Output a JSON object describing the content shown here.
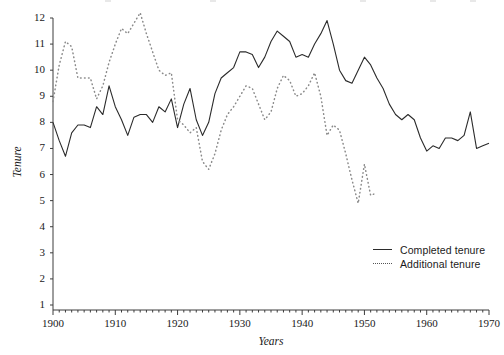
{
  "chart_data": {
    "type": "line",
    "title": "",
    "xlabel": "Years",
    "ylabel": "Tenure",
    "xlim": [
      1900,
      1970
    ],
    "ylim": [
      0,
      12
    ],
    "xticks": [
      1900,
      1910,
      1920,
      1930,
      1940,
      1950,
      1960,
      1970
    ],
    "yticks": [
      1,
      2,
      3,
      4,
      5,
      6,
      7,
      8,
      9,
      10,
      11,
      12
    ],
    "xtick_labels": [
      "1900",
      "1910",
      "1920",
      "1930",
      "1940",
      "1950",
      "1960",
      "1970"
    ],
    "ytick_labels": [
      "1",
      "2",
      "3",
      "4",
      "5",
      "6",
      "7",
      "8",
      "9",
      "10",
      "11",
      "12"
    ],
    "grid": false,
    "legend_position": "lower-right",
    "series": [
      {
        "name": "Completed tenure",
        "style": "solid",
        "color": "#2b2b2b",
        "x": [
          1900,
          1901,
          1902,
          1903,
          1904,
          1905,
          1906,
          1907,
          1908,
          1909,
          1910,
          1911,
          1912,
          1913,
          1914,
          1915,
          1916,
          1917,
          1918,
          1919,
          1920,
          1921,
          1922,
          1923,
          1924,
          1925,
          1926,
          1927,
          1928,
          1929,
          1930,
          1931,
          1932,
          1933,
          1934,
          1935,
          1936,
          1937,
          1938,
          1939,
          1940,
          1941,
          1942,
          1943,
          1944,
          1945,
          1946,
          1947,
          1948,
          1949,
          1950,
          1951,
          1952,
          1953,
          1954,
          1955,
          1956,
          1957,
          1958,
          1959,
          1960,
          1961,
          1962,
          1963,
          1964,
          1965,
          1966,
          1967,
          1968,
          1969,
          1970
        ],
        "values": [
          8.0,
          7.3,
          6.7,
          7.6,
          7.9,
          7.9,
          7.8,
          8.6,
          8.3,
          9.4,
          8.6,
          8.1,
          7.5,
          8.2,
          8.3,
          8.3,
          8.0,
          8.6,
          8.4,
          8.9,
          7.8,
          8.7,
          9.3,
          8.1,
          7.5,
          8.0,
          9.1,
          9.7,
          9.9,
          10.1,
          10.7,
          10.7,
          10.6,
          10.1,
          10.5,
          11.1,
          11.5,
          11.3,
          11.1,
          10.5,
          10.6,
          10.5,
          11.0,
          11.4,
          11.9,
          11.0,
          10.0,
          9.6,
          9.5,
          10.0,
          10.5,
          10.2,
          9.7,
          9.3,
          8.7,
          8.3,
          8.1,
          8.3,
          8.1,
          7.4,
          6.9,
          7.1,
          7.0,
          7.4,
          7.4,
          7.3,
          7.5,
          8.4,
          7.0,
          7.1,
          7.2
        ]
      },
      {
        "name": "Additional tenure",
        "style": "dotted",
        "color": "#808080",
        "x": [
          1900,
          1901,
          1902,
          1903,
          1904,
          1905,
          1906,
          1907,
          1908,
          1909,
          1910,
          1911,
          1912,
          1913,
          1914,
          1915,
          1916,
          1917,
          1918,
          1919,
          1920,
          1921,
          1922,
          1923,
          1924,
          1925,
          1926,
          1927,
          1928,
          1929,
          1930,
          1931,
          1932,
          1933,
          1934,
          1935,
          1936,
          1937,
          1938,
          1939,
          1940,
          1941,
          1942,
          1943,
          1944,
          1945,
          1946,
          1947,
          1948,
          1949,
          1950,
          1951,
          1952
        ],
        "values": [
          8.8,
          10.2,
          11.1,
          10.9,
          9.7,
          9.7,
          9.7,
          8.9,
          9.4,
          10.3,
          11.0,
          11.6,
          11.4,
          11.8,
          12.2,
          11.4,
          10.7,
          10.0,
          9.8,
          9.9,
          8.1,
          7.9,
          7.6,
          7.8,
          6.5,
          6.2,
          6.8,
          7.7,
          8.3,
          8.6,
          9.0,
          9.4,
          9.3,
          8.7,
          8.1,
          8.4,
          9.3,
          9.8,
          9.6,
          9.0,
          9.1,
          9.4,
          9.9,
          9.0,
          7.5,
          7.9,
          7.7,
          6.8,
          5.8,
          4.9,
          6.4,
          5.2,
          5.3
        ]
      }
    ],
    "annotations": []
  },
  "axes": {
    "ylabel": "Tenure",
    "xlabel": "Years"
  },
  "legend": {
    "items": [
      {
        "label": "Completed tenure",
        "style": "solid"
      },
      {
        "label": "Additional tenure",
        "style": "dotted"
      }
    ]
  }
}
